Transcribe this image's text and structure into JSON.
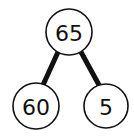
{
  "diagram": {
    "type": "binary-tree",
    "nodes": [
      {
        "id": "root",
        "label": "65",
        "cx": 69,
        "cy": 32,
        "r": 23
      },
      {
        "id": "left",
        "label": "60",
        "cx": 36,
        "cy": 106,
        "r": 23
      },
      {
        "id": "right",
        "label": "5",
        "cx": 106,
        "cy": 106,
        "r": 22
      }
    ],
    "edges": [
      {
        "from": "root",
        "to": "left"
      },
      {
        "from": "root",
        "to": "right"
      }
    ]
  }
}
